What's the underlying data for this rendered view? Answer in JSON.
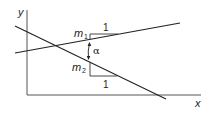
{
  "diagram": {
    "axes": {
      "x_label": "x",
      "y_label": "y"
    },
    "lines": [
      {
        "name": "line-1",
        "slope_label": "m",
        "slope_subscript": "1",
        "run_label": "1"
      },
      {
        "name": "line-2",
        "slope_label": "m",
        "slope_subscript": "2",
        "run_label": "1"
      }
    ],
    "angle_label": "α"
  }
}
